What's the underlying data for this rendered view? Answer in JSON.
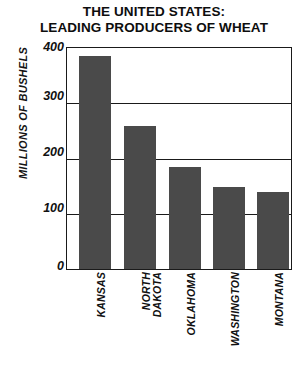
{
  "chart_data": {
    "type": "bar",
    "title": "THE UNITED STATES: LEADING PRODUCERS OF WHEAT",
    "title_line1": "THE UNITED STATES:",
    "title_line2": "LEADING PRODUCERS OF WHEAT",
    "xlabel": "",
    "ylabel": "MILLIONS OF BUSHELS",
    "categories": [
      "KANSAS",
      "NORTH\nDAKOTA",
      "OKLAHOMA",
      "WASHINGTON",
      "MONTANA"
    ],
    "values": [
      385,
      258,
      185,
      148,
      140
    ],
    "ylim": [
      0,
      400
    ],
    "yticks": [
      0,
      100,
      200,
      300,
      400
    ],
    "ytick_labels": [
      "0",
      "100",
      "200",
      "300",
      "400"
    ],
    "grid": true,
    "grid_axis": "y",
    "legend": false,
    "bar_color": "#4a4a4a",
    "frame_color": "#1a1a1a",
    "background": "#ffffff"
  },
  "labels": {
    "tick_0": "0",
    "tick_100": "100",
    "tick_200": "200",
    "tick_300": "300",
    "tick_400": "400",
    "cat_kansas": "KANSAS",
    "cat_north_dakota": "NORTH\nDAKOTA",
    "cat_oklahoma": "OKLAHOMA",
    "cat_washington": "WASHINGTON",
    "cat_montana": "MONTANA"
  }
}
